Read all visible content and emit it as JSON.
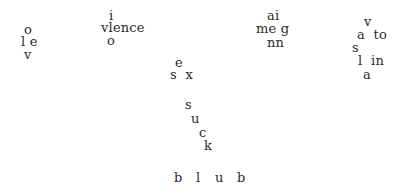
{
  "page": {
    "width": 404,
    "height": 196,
    "background": "#ffffff",
    "text_color": "#2a2a2a"
  },
  "clusters": [
    {
      "name": "cluster-love",
      "fragments": [
        {
          "text": "o",
          "x": 24,
          "y": 23
        },
        {
          "text": "l e",
          "x": 21,
          "y": 35
        },
        {
          "text": "v",
          "x": 24,
          "y": 48
        }
      ]
    },
    {
      "name": "cluster-violence",
      "fragments": [
        {
          "text": "i",
          "x": 109,
          "y": 9
        },
        {
          "text": "vlence",
          "x": 101,
          "y": 21
        },
        {
          "text": "o",
          "x": 107,
          "y": 34
        }
      ]
    },
    {
      "name": "cluster-ai-meg-nn",
      "fragments": [
        {
          "text": "ai",
          "x": 267,
          "y": 9
        },
        {
          "text": "me g",
          "x": 256,
          "y": 22
        },
        {
          "text": "nn",
          "x": 267,
          "y": 36
        }
      ]
    },
    {
      "name": "cluster-right",
      "fragments": [
        {
          "text": "v",
          "x": 364,
          "y": 15
        },
        {
          "text": "a  to",
          "x": 357,
          "y": 28
        },
        {
          "text": "s",
          "x": 352,
          "y": 41
        },
        {
          "text": "l  in",
          "x": 358,
          "y": 54
        },
        {
          "text": "a",
          "x": 363,
          "y": 68
        }
      ]
    },
    {
      "name": "cluster-sex",
      "fragments": [
        {
          "text": "e",
          "x": 175,
          "y": 56
        },
        {
          "text": "s  x",
          "x": 170,
          "y": 68
        }
      ]
    },
    {
      "name": "cluster-suck",
      "fragments": [
        {
          "text": "s",
          "x": 185,
          "y": 98
        },
        {
          "text": "u",
          "x": 191,
          "y": 112
        },
        {
          "text": "c",
          "x": 199,
          "y": 126
        },
        {
          "text": "k",
          "x": 204,
          "y": 139
        }
      ]
    },
    {
      "name": "cluster-blub",
      "fragments": [
        {
          "text": "b",
          "x": 174,
          "y": 171
        },
        {
          "text": "l",
          "x": 196,
          "y": 171
        },
        {
          "text": "u",
          "x": 215,
          "y": 171
        },
        {
          "text": "b",
          "x": 237,
          "y": 171
        }
      ]
    }
  ]
}
